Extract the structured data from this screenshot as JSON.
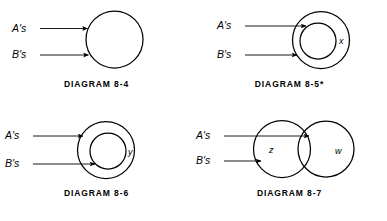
{
  "figure": {
    "background_color": "#ffffff",
    "stroke_color": "#000000",
    "panels": [
      {
        "id": "diagram-8-4",
        "caption": "DIAGRAM 8-4",
        "inputs": [
          {
            "label": "A's",
            "terminates_at": "outer-circle"
          },
          {
            "label": "B's",
            "terminates_at": "outer-circle"
          }
        ],
        "regions": [],
        "shapes": "one circle"
      },
      {
        "id": "diagram-8-5",
        "caption": "DIAGRAM 8-5*",
        "inputs": [
          {
            "label": "A's",
            "terminates_at": "inner-circle"
          },
          {
            "label": "B's",
            "terminates_at": "outer-circle"
          }
        ],
        "regions": [
          {
            "label": "x",
            "position": "between outer and inner circle, right side"
          }
        ],
        "shapes": "circle within circle"
      },
      {
        "id": "diagram-8-6",
        "caption": "DIAGRAM 8-6",
        "inputs": [
          {
            "label": "A's",
            "terminates_at": "outer-circle"
          },
          {
            "label": "B's",
            "terminates_at": "inner-circle"
          }
        ],
        "regions": [
          {
            "label": "y",
            "position": "between outer and inner circle, right side"
          }
        ],
        "shapes": "circle within circle"
      },
      {
        "id": "diagram-8-7",
        "caption": "DIAGRAM 8-7",
        "inputs": [
          {
            "label": "A's",
            "terminates_at": "overlap-region"
          },
          {
            "label": "B's",
            "terminates_at": "left-circle"
          }
        ],
        "regions": [
          {
            "label": "z",
            "position": "left circle, left of overlap"
          },
          {
            "label": "w",
            "position": "right circle, right of overlap"
          }
        ],
        "shapes": "two overlapping circles"
      }
    ]
  }
}
